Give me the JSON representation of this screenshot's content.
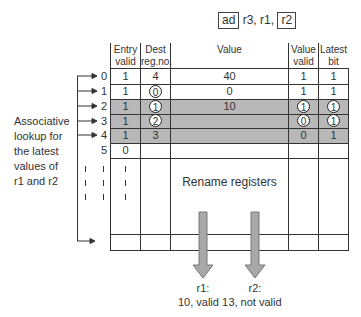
{
  "instruction": {
    "opcode": "ad",
    "operands_middle": "r3, r1,",
    "last_operand": "r2"
  },
  "side_label": [
    "Associative",
    "lookup for",
    "the latest",
    "values of",
    "r1 and r2"
  ],
  "table": {
    "headers": {
      "entry_valid": [
        "Entry",
        "valid"
      ],
      "dest_reg": [
        "Dest",
        "reg.no."
      ],
      "value": "Value",
      "value_valid": [
        "Value",
        "valid"
      ],
      "latest_bit": [
        "Latest",
        "bit"
      ]
    },
    "rows": [
      {
        "index": "0",
        "entry_valid": "1",
        "dest": "4",
        "dest_circled": false,
        "value": "40",
        "value_valid": "1",
        "vv_circled": false,
        "latest": "1",
        "latest_circled": false,
        "shaded": false
      },
      {
        "index": "1",
        "entry_valid": "1",
        "dest": "0",
        "dest_circled": true,
        "value": "0",
        "value_valid": "1",
        "vv_circled": false,
        "latest": "1",
        "latest_circled": false,
        "shaded": false
      },
      {
        "index": "2",
        "entry_valid": "1",
        "dest": "1",
        "dest_circled": true,
        "value": "10",
        "value_valid": "1",
        "vv_circled": true,
        "latest": "1",
        "latest_circled": true,
        "shaded": true
      },
      {
        "index": "3",
        "entry_valid": "1",
        "dest": "2",
        "dest_circled": true,
        "value": "",
        "value_valid": "0",
        "vv_circled": true,
        "latest": "1",
        "latest_circled": true,
        "shaded": true
      },
      {
        "index": "4",
        "entry_valid": "1",
        "dest": "3",
        "dest_circled": false,
        "value": "",
        "value_valid": "0",
        "vv_circled": false,
        "latest": "1",
        "latest_circled": false,
        "shaded": true
      },
      {
        "index": "5",
        "entry_valid": "0",
        "dest": "",
        "dest_circled": false,
        "value": "",
        "value_valid": "",
        "vv_circled": false,
        "latest": "",
        "latest_circled": false,
        "shaded": false
      }
    ],
    "body_label": "Rename registers"
  },
  "outputs": {
    "r1": {
      "label": "r1:",
      "result": "10, valid 1"
    },
    "r2": {
      "label": "r2:",
      "result": "3, not valid"
    }
  },
  "colors": {
    "shade": "#b8b8b8",
    "arrow_fill": "#a8a8a8",
    "line": "#333333"
  }
}
